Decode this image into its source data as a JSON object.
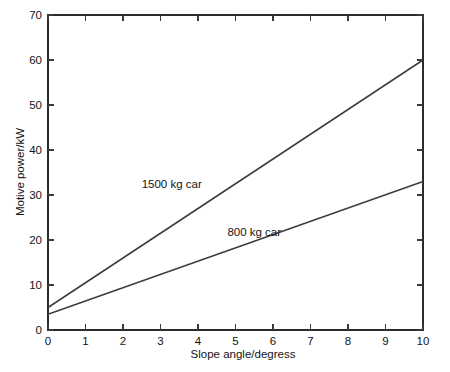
{
  "figure": {
    "background_color": "#ffffff",
    "frame_color": "#2b2b2b",
    "width": 450,
    "height": 372
  },
  "chart_data": {
    "type": "line",
    "title": "",
    "subtitle": "",
    "xlabel": "Slope angle/degress",
    "ylabel": "Motive power/kW",
    "xlim": [
      0,
      10
    ],
    "ylim": [
      0,
      70
    ],
    "xticks": [
      0,
      1,
      2,
      3,
      4,
      5,
      6,
      7,
      8,
      9,
      10
    ],
    "yticks": [
      0,
      10,
      20,
      30,
      40,
      50,
      60,
      70
    ],
    "xtick_labels": [
      "0",
      "1",
      "2",
      "3",
      "4",
      "5",
      "6",
      "7",
      "8",
      "9",
      "10"
    ],
    "ytick_labels": [
      "0",
      "10",
      "20",
      "30",
      "40",
      "50",
      "60",
      "70"
    ],
    "grid": false,
    "legend": "inline-annotations",
    "x": [
      0,
      10
    ],
    "series": [
      {
        "name": "1500 kg car",
        "color": "#3c3c3c",
        "values": [
          5.0,
          60.0
        ],
        "label_x": 3.3,
        "label_y": 31.5
      },
      {
        "name": "800 kg car",
        "color": "#3c3c3c",
        "values": [
          3.5,
          33.0
        ],
        "label_x": 5.5,
        "label_y": 21.0
      }
    ],
    "annotations": [
      {
        "text": "1500 kg car",
        "x": 3.3,
        "y": 31.5
      },
      {
        "text": "800 kg car",
        "x": 5.5,
        "y": 21.0
      }
    ]
  }
}
